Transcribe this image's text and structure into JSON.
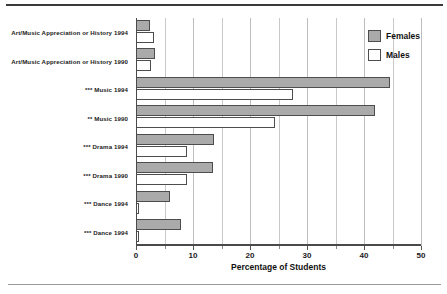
{
  "chart_data": {
    "type": "bar",
    "orientation": "horizontal",
    "title": "",
    "xlabel": "Percentage of Students",
    "ylabel": "",
    "xlim": [
      0,
      50
    ],
    "xticks": [
      0,
      10,
      20,
      30,
      40,
      50
    ],
    "xtick_labels": [
      "0",
      "10",
      "20",
      "30",
      "40",
      "50"
    ],
    "minor_xticks": [
      5,
      15,
      25,
      35,
      45
    ],
    "grid": true,
    "grid_axis": "x",
    "grid_interval": 5,
    "legend_position": "top-right",
    "categories": [
      "Art/Music Appreciation or History 1994",
      "Art/Music Appreciation or History 1990",
      "*** Music 1994",
      "** Music 1990",
      "*** Drama 1994",
      "*** Drama 1990",
      "*** Dance 1994",
      "*** Dance 1994"
    ],
    "series": [
      {
        "name": "Females",
        "color": "#aaaaaa",
        "values": [
          2.5,
          3.3,
          44.5,
          42.0,
          13.7,
          13.5,
          5.9,
          7.9
        ]
      },
      {
        "name": "Males",
        "color": "#ffffff",
        "values": [
          3.1,
          2.6,
          27.5,
          24.3,
          9.0,
          9.0,
          0.5,
          0.6
        ]
      }
    ]
  },
  "legend": {
    "entries": [
      {
        "label": "Females",
        "swatch": "gray-filled-square"
      },
      {
        "label": "Males",
        "swatch": "white-outlined-square"
      }
    ]
  },
  "colors": {
    "female_fill": "#aaaaaa",
    "male_fill": "#ffffff",
    "bar_outline": "#4d4d4d",
    "gridline": "#c8c8c8",
    "axis": "#4a4a4a",
    "rule_top": "#3a3a3a",
    "rule_bottom": "#9a9a9a"
  }
}
